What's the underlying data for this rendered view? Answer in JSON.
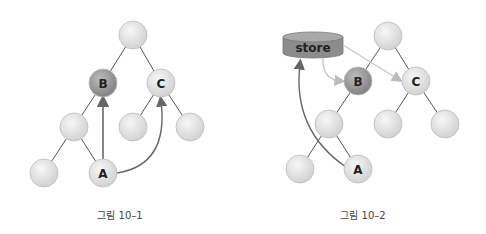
{
  "figures": [
    {
      "caption": "그림 10–1",
      "nodes": [
        {
          "id": "root",
          "label": "",
          "x": 133,
          "y": 35,
          "dark": false
        },
        {
          "id": "B",
          "label": "B",
          "x": 103,
          "y": 83,
          "dark": true
        },
        {
          "id": "C",
          "label": "C",
          "x": 161,
          "y": 83,
          "dark": false
        },
        {
          "id": "b-left",
          "label": "",
          "x": 74,
          "y": 127,
          "dark": false
        },
        {
          "id": "c-left",
          "label": "",
          "x": 133,
          "y": 127,
          "dark": false
        },
        {
          "id": "c-right",
          "label": "",
          "x": 190,
          "y": 127,
          "dark": false
        },
        {
          "id": "leaf-left",
          "label": "",
          "x": 44,
          "y": 173,
          "dark": false
        },
        {
          "id": "A",
          "label": "A",
          "x": 103,
          "y": 173,
          "dark": false
        }
      ],
      "edges": [
        [
          "root",
          "B"
        ],
        [
          "root",
          "C"
        ],
        [
          "B",
          "b-left"
        ],
        [
          "b-left",
          "leaf-left"
        ],
        [
          "b-left",
          "A"
        ],
        [
          "C",
          "c-left"
        ],
        [
          "C",
          "c-right"
        ]
      ],
      "arrows": [
        {
          "from": "A",
          "to": "B",
          "type": "straight"
        },
        {
          "from": "A",
          "to": "C",
          "type": "curve"
        }
      ]
    },
    {
      "caption": "그림 10–2",
      "store_label": "store",
      "nodes": [
        {
          "id": "root",
          "label": "",
          "x": 388,
          "y": 36,
          "dark": false
        },
        {
          "id": "B",
          "label": "B",
          "x": 358,
          "y": 81,
          "dark": true
        },
        {
          "id": "C",
          "label": "C",
          "x": 416,
          "y": 81,
          "dark": false
        },
        {
          "id": "b-left",
          "label": "",
          "x": 329,
          "y": 124,
          "dark": false
        },
        {
          "id": "c-left",
          "label": "",
          "x": 388,
          "y": 124,
          "dark": false
        },
        {
          "id": "c-right",
          "label": "",
          "x": 445,
          "y": 124,
          "dark": false
        },
        {
          "id": "leaf-left",
          "label": "",
          "x": 300,
          "y": 169,
          "dark": false
        },
        {
          "id": "A",
          "label": "A",
          "x": 358,
          "y": 169,
          "dark": false
        }
      ],
      "edges": [
        [
          "root",
          "B"
        ],
        [
          "root",
          "C"
        ],
        [
          "B",
          "b-left"
        ],
        [
          "b-left",
          "leaf-left"
        ],
        [
          "b-left",
          "A"
        ],
        [
          "C",
          "c-left"
        ],
        [
          "C",
          "c-right"
        ]
      ],
      "arrows": [
        {
          "from": "A",
          "to": "store",
          "type": "curve"
        },
        {
          "from": "store",
          "to": "B",
          "type": "curve"
        },
        {
          "from": "store",
          "to": "C",
          "type": "straight"
        }
      ]
    }
  ],
  "colors": {
    "node_light": "#e2e2e2",
    "node_dark": "#9a9a9a",
    "node_stroke": "#bdbdbd",
    "edge": "#555555",
    "arrow_dark": "#666666",
    "arrow_light": "#c8c8c8",
    "store_fill": "#8c8c8c",
    "store_top": "#a9a9a9"
  }
}
